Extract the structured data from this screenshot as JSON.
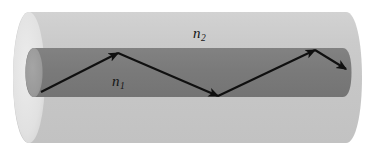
{
  "figure": {
    "name": "optical-fiber-total-internal-reflection",
    "width": 371,
    "height": 151,
    "background_color": "#ffffff"
  },
  "labels": {
    "cladding_symbol": "n",
    "cladding_subscript": "2",
    "core_symbol": "n",
    "core_subscript": "1"
  },
  "colors": {
    "cladding_body": "#c9c9c9",
    "cladding_face": "#e3e3e3",
    "cladding_face_shade": "#d8d8d8",
    "core_body": "#7b7b7b",
    "core_face": "#9c9c9c",
    "core_edge": "#8e8e8e",
    "ray": "#101010",
    "background": "#ffffff"
  },
  "geometry": {
    "cladding_top_y": 12,
    "cladding_bottom_y": 143,
    "cladding_left_x": 13,
    "cladding_right_x": 362,
    "core_top_y": 48,
    "core_bottom_y": 97,
    "core_left_x": 26,
    "core_right_x": 351,
    "left_face_rx": 16,
    "left_face_ry": 66
  },
  "ray_path": {
    "type": "zigzag-total-internal-reflection",
    "points": [
      {
        "x": 41,
        "y": 92,
        "kind": "entry"
      },
      {
        "x": 118,
        "y": 53,
        "kind": "reflection-top"
      },
      {
        "x": 218,
        "y": 96,
        "kind": "reflection-bottom"
      },
      {
        "x": 315,
        "y": 50,
        "kind": "reflection-top"
      },
      {
        "x": 346,
        "y": 69,
        "kind": "exit"
      }
    ],
    "arrowheads_at": [
      1,
      2,
      3,
      4
    ],
    "stroke_width": 2.1
  }
}
